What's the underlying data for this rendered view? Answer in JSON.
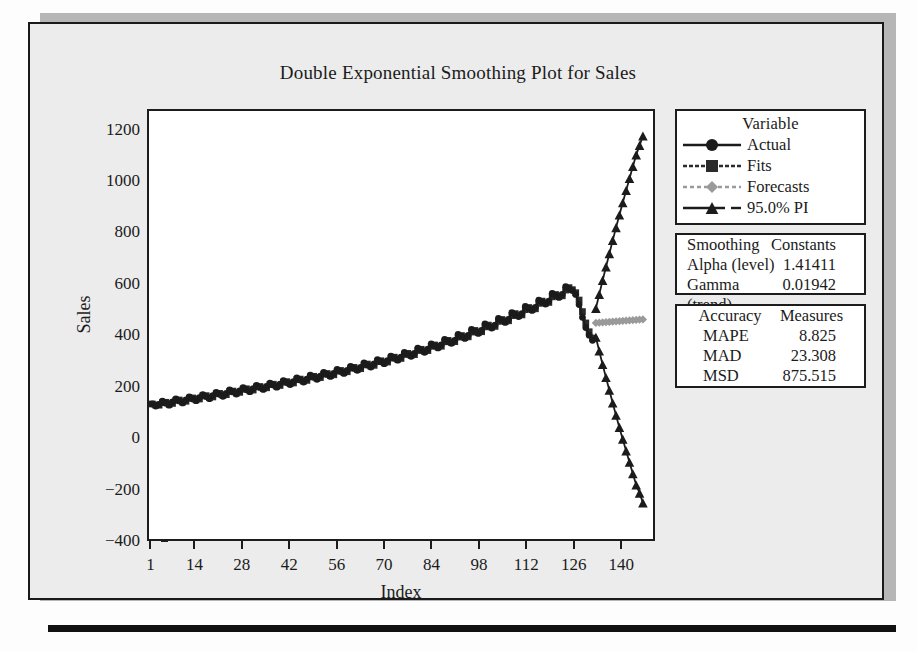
{
  "chart_data": {
    "type": "line",
    "title": "Double Exponential Smoothing Plot for Sales",
    "xlabel": "Index",
    "ylabel": "Sales",
    "xlim": [
      0,
      150
    ],
    "ylim": [
      -400,
      1280
    ],
    "yticks": [
      1200,
      1000,
      800,
      600,
      400,
      200,
      0,
      -200,
      -400
    ],
    "xticks": [
      1,
      14,
      28,
      42,
      56,
      70,
      84,
      98,
      112,
      126,
      140
    ],
    "grid": false,
    "legend_position": "right",
    "series": [
      {
        "name": "Actual",
        "marker": "circle",
        "line": "solid",
        "color": "#1b1b1b",
        "x": [
          1,
          2,
          3,
          4,
          5,
          6,
          7,
          8,
          9,
          10,
          11,
          12,
          13,
          14,
          15,
          16,
          17,
          18,
          19,
          20,
          21,
          22,
          23,
          24,
          25,
          26,
          27,
          28,
          29,
          30,
          31,
          32,
          33,
          34,
          35,
          36,
          37,
          38,
          39,
          40,
          41,
          42,
          43,
          44,
          45,
          46,
          47,
          48,
          49,
          50,
          51,
          52,
          53,
          54,
          55,
          56,
          57,
          58,
          59,
          60,
          61,
          62,
          63,
          64,
          65,
          66,
          67,
          68,
          69,
          70,
          71,
          72,
          73,
          74,
          75,
          76,
          77,
          78,
          79,
          80,
          81,
          82,
          83,
          84,
          85,
          86,
          87,
          88,
          89,
          90,
          91,
          92,
          93,
          94,
          95,
          96,
          97,
          98,
          99,
          100,
          101,
          102,
          103,
          104,
          105,
          106,
          107,
          108,
          109,
          110,
          111,
          112,
          113,
          114,
          115,
          116,
          117,
          118,
          119,
          120,
          121,
          122,
          123,
          124,
          125,
          126,
          127,
          128,
          129,
          130,
          131,
          132
        ],
        "y": [
          130,
          122,
          128,
          141,
          133,
          125,
          138,
          150,
          142,
          134,
          146,
          158,
          150,
          143,
          155,
          167,
          159,
          151,
          163,
          176,
          168,
          160,
          172,
          185,
          177,
          169,
          181,
          194,
          186,
          178,
          190,
          203,
          195,
          187,
          199,
          212,
          204,
          196,
          208,
          222,
          214,
          206,
          218,
          232,
          224,
          216,
          228,
          243,
          235,
          227,
          239,
          254,
          246,
          238,
          250,
          266,
          258,
          250,
          262,
          278,
          270,
          262,
          274,
          291,
          283,
          275,
          287,
          304,
          296,
          288,
          300,
          318,
          310,
          302,
          314,
          333,
          325,
          317,
          329,
          349,
          341,
          333,
          345,
          366,
          358,
          350,
          362,
          384,
          376,
          368,
          380,
          403,
          395,
          387,
          399,
          423,
          415,
          407,
          419,
          444,
          436,
          428,
          440,
          466,
          458,
          450,
          462,
          489,
          481,
          473,
          485,
          513,
          505,
          497,
          509,
          538,
          530,
          522,
          534,
          564,
          556,
          548,
          560,
          591,
          583,
          575,
          560,
          520,
          470,
          430,
          400,
          380
        ]
      },
      {
        "name": "Fits",
        "marker": "square",
        "line": "dashed",
        "color": "#2b2b2b",
        "note": "overlays Actual almost exactly"
      },
      {
        "name": "Forecasts",
        "marker": "diamond",
        "line": "dashed",
        "color": "#9a9a9a",
        "x": [
          133,
          134,
          135,
          136,
          137,
          138,
          139,
          140,
          141,
          142,
          143,
          144,
          145,
          146,
          147
        ],
        "y": [
          448,
          449,
          450,
          451,
          452,
          453,
          454,
          455,
          456,
          457,
          458,
          459,
          460,
          461,
          462
        ]
      },
      {
        "name": "95.0% PI",
        "marker": "triangle",
        "line": "solid",
        "color": "#1b1b1b",
        "upper_x": [
          133,
          134,
          135,
          136,
          137,
          138,
          139,
          140,
          141,
          142,
          143,
          144,
          145,
          146,
          147
        ],
        "upper_y": [
          505,
          560,
          615,
          668,
          720,
          772,
          822,
          872,
          920,
          968,
          1015,
          1062,
          1108,
          1145,
          1182
        ],
        "lower_x": [
          133,
          134,
          135,
          136,
          137,
          138,
          139,
          140,
          141,
          142,
          143,
          144,
          145,
          146,
          147
        ],
        "lower_y": [
          392,
          338,
          285,
          234,
          184,
          134,
          86,
          38,
          -8,
          -54,
          -99,
          -144,
          -188,
          -220,
          -258
        ]
      }
    ]
  },
  "legend": {
    "header": "Variable",
    "items": [
      {
        "label": "Actual",
        "symbol": "circle-marker"
      },
      {
        "label": "Fits",
        "symbol": "square-marker"
      },
      {
        "label": "Forecasts",
        "symbol": "diamond-marker"
      },
      {
        "label": "95.0% PI",
        "symbol": "triangle-marker"
      }
    ]
  },
  "smoothing_constants": {
    "header_left": "Smoothing",
    "header_right": "Constants",
    "rows": [
      {
        "key": "Alpha (level)",
        "value": "1.41411"
      },
      {
        "key": "Gamma (trend)",
        "value": "0.01942"
      }
    ]
  },
  "accuracy_measures": {
    "header_left": "Accuracy",
    "header_right": "Measures",
    "rows": [
      {
        "key": "MAPE",
        "value": "8.825"
      },
      {
        "key": "MAD",
        "value": "23.308"
      },
      {
        "key": "MSD",
        "value": "875.515"
      }
    ]
  },
  "colors": {
    "ink": "#1b1b1b",
    "forecast_gray": "#9a9a9a",
    "panel_bg": "#ececec",
    "plot_bg": "#ffffff"
  }
}
